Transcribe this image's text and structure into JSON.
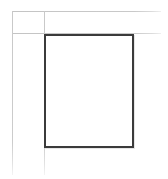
{
  "diagram": {
    "type": "layout-frame",
    "canvas": {
      "width": 168,
      "height": 179,
      "background": "#ffffff"
    },
    "colors": {
      "frame_stroke": "#3b3b3b",
      "guide_stroke": "#c9c9c9",
      "background": "#ffffff",
      "shadow": "#e6e6e6"
    },
    "frame": {
      "label": "page-frame",
      "x": 44,
      "y": 34,
      "width": 90,
      "height": 114,
      "stroke_width": 2,
      "fill": "none"
    },
    "guides": [
      {
        "label": "top-margin-guide",
        "orientation": "horizontal",
        "x": 12,
        "y": 11,
        "length": 149
      },
      {
        "label": "frame-top-guide",
        "orientation": "horizontal",
        "x": 12,
        "y": 33,
        "length": 149
      },
      {
        "label": "left-margin-guide",
        "orientation": "vertical",
        "x": 12,
        "y": 11,
        "length": 164
      },
      {
        "label": "frame-left-guide",
        "orientation": "vertical",
        "x": 44,
        "y": 11,
        "length": 164
      }
    ]
  }
}
